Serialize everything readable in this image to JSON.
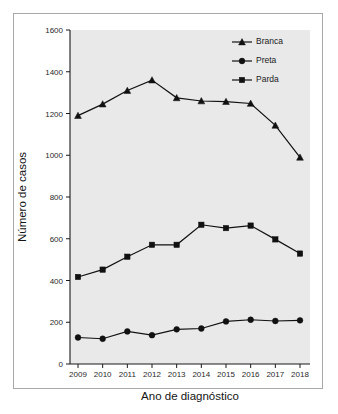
{
  "chart_data": {
    "type": "line",
    "title": "",
    "xlabel": "Ano de diagnóstico",
    "ylabel": "Número de casos",
    "categories": [
      "2009",
      "2010",
      "2011",
      "2012",
      "2013",
      "2014",
      "2015",
      "2016",
      "2017",
      "2018"
    ],
    "x": [
      2009,
      2010,
      2011,
      2012,
      2013,
      2014,
      2015,
      2016,
      2017,
      2018
    ],
    "ylim": [
      0,
      1600
    ],
    "yticks": [
      0,
      200,
      400,
      600,
      800,
      1000,
      1200,
      1400,
      1600
    ],
    "ytick_labels": [
      "0",
      "200",
      "400",
      "600",
      "800",
      "1000",
      "1200",
      "1400",
      "1600"
    ],
    "grid": false,
    "legend_position": "top-right",
    "series": [
      {
        "name": "Branca",
        "marker": "triangle",
        "color": "#111111",
        "values": [
          1190,
          1245,
          1310,
          1360,
          1275,
          1260,
          1257,
          1248,
          1143,
          990
        ]
      },
      {
        "name": "Preta",
        "marker": "circle",
        "color": "#111111",
        "values": [
          127,
          121,
          156,
          138,
          166,
          170,
          204,
          212,
          206,
          209
        ]
      },
      {
        "name": "Parda",
        "marker": "square",
        "color": "#111111",
        "values": [
          417,
          452,
          514,
          571,
          571,
          667,
          651,
          663,
          597,
          529
        ]
      }
    ]
  },
  "legend": {
    "items": [
      {
        "label": "Branca",
        "marker": "triangle"
      },
      {
        "label": "Preta",
        "marker": "circle"
      },
      {
        "label": "Parda",
        "marker": "square"
      }
    ]
  },
  "axes": {
    "x_title": "Ano de diagnóstico",
    "y_title": "Número de casos"
  }
}
